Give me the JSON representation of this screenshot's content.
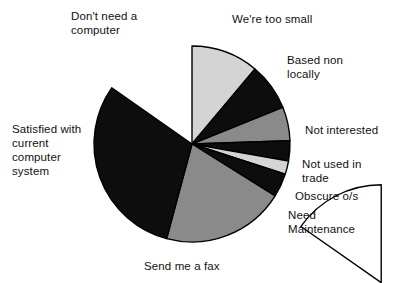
{
  "chart_data": {
    "type": "pie",
    "title": "",
    "xlabel": "",
    "ylabel": "",
    "legend_position": "labels-around-pie",
    "grid": false,
    "start_angle_deg": 0,
    "direction": "clockwise",
    "center": {
      "x": 192,
      "y": 144
    },
    "radius": 98,
    "categories": [
      "We're too small",
      "Based non locally",
      "Not interested",
      "Not used in trade",
      "Obscure o/s",
      "Need Maintenance",
      "Send me a fax",
      "Satisfied with current computer system",
      "Don't need a computer"
    ],
    "values": [
      11.1,
      7.8,
      5.6,
      3.3,
      2.2,
      3.9,
      20.3,
      30.6,
      15.2
    ],
    "slices": [
      {
        "label": "We're too small",
        "label_lines": "We're too small",
        "value": 11.1,
        "start_deg": 0,
        "end_deg": 40,
        "color": "#d4d4d4",
        "exploded": false
      },
      {
        "label": "Based non locally",
        "label_lines": "Based non\nlocally",
        "value": 7.8,
        "start_deg": 40,
        "end_deg": 68,
        "color": "#0d0d0d",
        "exploded": false
      },
      {
        "label": "Not interested",
        "label_lines": "Not interested",
        "value": 5.6,
        "start_deg": 68,
        "end_deg": 88,
        "color": "#8a8a8a",
        "exploded": false
      },
      {
        "label": "Not used in trade",
        "label_lines": "Not used in\ntrade",
        "value": 3.3,
        "start_deg": 88,
        "end_deg": 100,
        "color": "#0d0d0d",
        "exploded": false
      },
      {
        "label": "Obscure o/s",
        "label_lines": "Obscure o/s",
        "value": 2.2,
        "start_deg": 100,
        "end_deg": 108,
        "color": "#d4d4d4",
        "exploded": false
      },
      {
        "label": "Need Maintenance",
        "label_lines": "Need\nMaintenance",
        "value": 3.9,
        "start_deg": 108,
        "end_deg": 122,
        "color": "#0d0d0d",
        "exploded": false
      },
      {
        "label": "Send me a fax",
        "label_lines": "Send me a fax",
        "value": 20.3,
        "start_deg": 122,
        "end_deg": 195,
        "color": "#8a8a8a",
        "exploded": false
      },
      {
        "label": "Satisfied with current computer system",
        "label_lines": "Satisfied with\ncurrent\ncomputer\nsystem",
        "value": 30.6,
        "start_deg": 195,
        "end_deg": 305,
        "color": "#0d0d0d",
        "exploded": false
      },
      {
        "label": "Don't need a computer",
        "label_lines": "Don't need a\ncomputer",
        "value": 15.2,
        "start_deg": 305,
        "end_deg": 360,
        "color": "#ffffff",
        "exploded": true
      }
    ],
    "colors": {
      "black": "#0d0d0d",
      "mid_gray": "#8a8a8a",
      "light_gray": "#d4d4d4",
      "white": "#ffffff",
      "outline": "#000000",
      "background": "#ffffff",
      "text": "#111111"
    }
  }
}
